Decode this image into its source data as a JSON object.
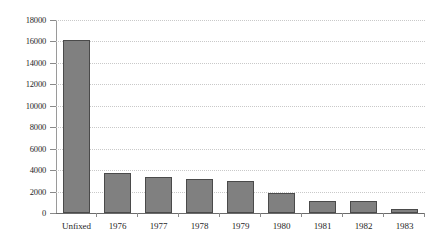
{
  "chart_data": {
    "type": "bar",
    "title": "",
    "subtitle": "",
    "xlabel": "",
    "ylabel": "",
    "categories": [
      "Unfixed",
      "1976",
      "1977",
      "1978",
      "1979",
      "1980",
      "1981",
      "1982",
      "1983"
    ],
    "values": [
      16100,
      3700,
      3400,
      3150,
      2950,
      1850,
      1150,
      1150,
      400
    ],
    "ylim": [
      0,
      18000
    ],
    "ytick_step": 2000,
    "ytick_labels": [
      "18000",
      "16000",
      "14000",
      "12000",
      "10000",
      "8000",
      "6000",
      "4000",
      "2000",
      "0"
    ],
    "ytick_values": [
      18000,
      16000,
      14000,
      12000,
      10000,
      8000,
      6000,
      4000,
      2000,
      0
    ],
    "grid": true,
    "grid_orientation": "horizontal",
    "grid_style": "dotted",
    "legend": false,
    "legend_position": "none",
    "series": [
      {
        "name": "",
        "values": [
          16100,
          3700,
          3400,
          3150,
          2950,
          1850,
          1150,
          1150,
          400
        ]
      }
    ],
    "colors": {
      "bar_fill": "#808080",
      "bar_border": "#4a4a4a",
      "gridline": "#c9c9c9",
      "axis": "#8a8a8a",
      "baseline": "#6b6b6b",
      "text": "#1f1f1f",
      "background": "#ffffff"
    }
  }
}
